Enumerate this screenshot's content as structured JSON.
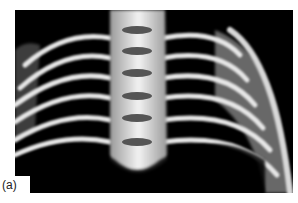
{
  "figure": {
    "label": "(a)",
    "colors": {
      "background": "#000000",
      "bone": "#e8e8e8",
      "page": "#ffffff"
    }
  }
}
